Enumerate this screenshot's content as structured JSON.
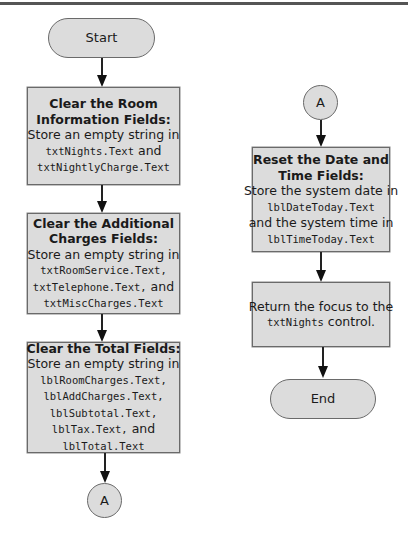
{
  "flowchart": {
    "left_column": {
      "start": {
        "label": "Start"
      },
      "box1": {
        "title_lines": [
          "Clear the Room",
          "Information Fields:"
        ],
        "body": [
          {
            "text": "Store an empty string in",
            "code": false
          },
          {
            "code_text": "txtNights.Text",
            "suffix": " and"
          },
          {
            "code_text": "txtNightlyCharge.Text",
            "suffix": ""
          }
        ]
      },
      "box2": {
        "title_lines": [
          "Clear the Additional",
          "Charges Fields:"
        ],
        "body": [
          {
            "text": "Store an empty string in"
          },
          {
            "code_text": "txtRoomService.Text,",
            "suffix": ""
          },
          {
            "code_text": "txtTelephone.Text,",
            "suffix": " and"
          },
          {
            "code_text": "txtMiscCharges.Text",
            "suffix": ""
          }
        ]
      },
      "box3": {
        "title_lines": [
          "Clear the Total Fields:"
        ],
        "body": [
          {
            "text": "Store an empty string in"
          },
          {
            "code_text": "lblRoomCharges.Text,",
            "suffix": ""
          },
          {
            "code_text": "lblAddCharges.Text,",
            "suffix": ""
          },
          {
            "code_text": "lblSubtotal.Text,",
            "suffix": ""
          },
          {
            "code_text": "lblTax.Text,",
            "suffix": " and"
          },
          {
            "code_text": "lblTotal.Text",
            "suffix": ""
          }
        ]
      },
      "connector": {
        "label": "A"
      }
    },
    "right_column": {
      "connector": {
        "label": "A"
      },
      "box1": {
        "title_lines": [
          "Reset the Date and",
          "Time Fields:"
        ],
        "body": [
          {
            "text": "Store the system date in"
          },
          {
            "code_text": "lblDateToday.Text",
            "suffix": ""
          },
          {
            "text": "and the system time in"
          },
          {
            "code_text": "lblTimeToday.Text",
            "suffix": ""
          }
        ]
      },
      "box2": {
        "body": [
          {
            "text": "Return the focus to the"
          },
          {
            "code_text": "txtNights",
            "suffix": " control."
          }
        ]
      },
      "end": {
        "label": "End"
      }
    }
  },
  "colors": {
    "node_fill": "#dcdcdc",
    "node_border": "#6a6a6a",
    "arrow": "#111111"
  }
}
